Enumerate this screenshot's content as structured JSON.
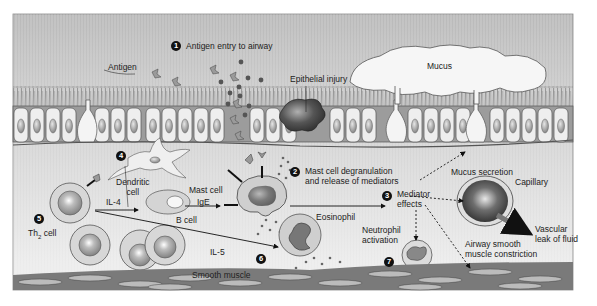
{
  "figure": {
    "palette": {
      "background_top": "#bdbdbd",
      "background_bottom": "#f2f2f2",
      "cilia": "#8a8a8a",
      "cell_fill": "#ececec",
      "nucleus": "#9a9a9a",
      "dark_cell": "#3a3a3a",
      "label_text": "#222222",
      "marker_fill": "#111111"
    }
  },
  "steps": [
    {
      "number": "1",
      "label": "Antigen entry to airway"
    },
    {
      "number": "2",
      "label_line1": "Mast cell degranulation",
      "label_line2": "and release of mediators"
    },
    {
      "number": "3",
      "label_line1": "Mediator",
      "label_line2": "effects"
    },
    {
      "number": "4"
    },
    {
      "number": "5"
    },
    {
      "number": "6"
    },
    {
      "number": "7"
    }
  ],
  "labels": {
    "antigen": "Antigen",
    "epithelial_injury": "Epithelial injury",
    "mucus": "Mucus",
    "dendritic_cell_line1": "Dendritic",
    "dendritic_cell_line2": "cell",
    "il4": "IL-4",
    "b_cell": "B cell",
    "mast_cell": "Mast cell",
    "ige": "IgE",
    "th2_cell_main": "Th",
    "th2_cell_sub": "2",
    "th2_cell_suffix": " cell",
    "il5": "IL-5",
    "eosinophil": "Eosinophil",
    "smooth_muscle": "Smooth muscle",
    "mucus_secretion": "Mucus secretion",
    "capillary": "Capillary",
    "vascular_line1": "Vascular",
    "vascular_line2": "leak of fluid",
    "neutrophil_line1": "Neutrophil",
    "neutrophil_line2": "activation",
    "airway_line1": "Airway smooth",
    "airway_line2": "muscle constriction"
  }
}
